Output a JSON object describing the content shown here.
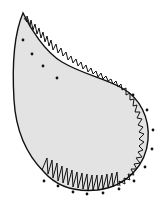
{
  "figure": {
    "title": "Paisley shape with blanket stitch edging",
    "shape": "paisley-teardrop",
    "colors": {
      "background": "#ffffff",
      "fill": "#e3e3e3",
      "outline": "#111111",
      "stitch": "#111111",
      "dots": "#111111"
    },
    "stitch_type": "zigzag / satin-edge stitch",
    "dot_count": 17
  }
}
